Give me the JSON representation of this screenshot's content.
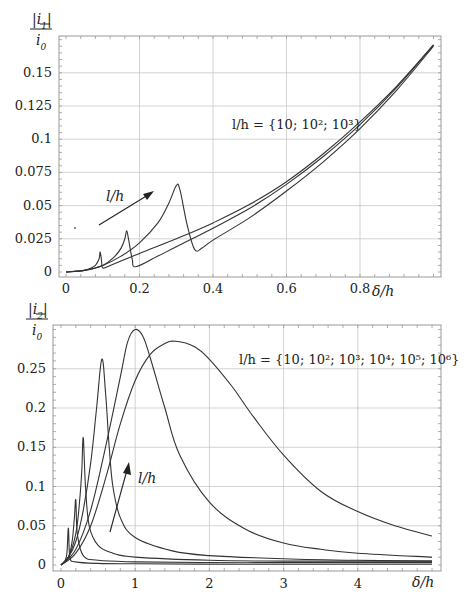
{
  "chart_data": [
    {
      "type": "line",
      "title": "",
      "ylabel": "|i_1| / i_0",
      "xlabel": "δ/h",
      "xlim": [
        0,
        1.02
      ],
      "ylim": [
        0,
        0.178
      ],
      "x_ticks": [
        "0",
        "0.2",
        "0.4",
        "0.6",
        "0.8"
      ],
      "y_ticks": [
        "0",
        "0.025",
        "0.05",
        "0.075",
        "0.1",
        "0.125",
        "0.15"
      ],
      "grid": true,
      "annotation": "l/h = {10; 10²; 10³}",
      "arrow_label": "l/h",
      "series": [
        {
          "name": "l/h = 10",
          "x": [
            0,
            0.03,
            0.06,
            0.08,
            0.09,
            0.093,
            0.097,
            0.1,
            0.12,
            0.2,
            0.3,
            0.4,
            0.5,
            0.6,
            0.7,
            0.8,
            0.9,
            1.0
          ],
          "y": [
            0,
            0.0005,
            0.002,
            0.005,
            0.01,
            0.015,
            0.008,
            0.003,
            0.005,
            0.014,
            0.025,
            0.037,
            0.051,
            0.068,
            0.089,
            0.113,
            0.14,
            0.171
          ]
        },
        {
          "name": "l/h = 100",
          "x": [
            0,
            0.05,
            0.1,
            0.13,
            0.15,
            0.16,
            0.165,
            0.17,
            0.18,
            0.19,
            0.25,
            0.3,
            0.4,
            0.5,
            0.6,
            0.7,
            0.8,
            0.9,
            1.0
          ],
          "y": [
            0,
            0.0012,
            0.005,
            0.011,
            0.018,
            0.025,
            0.031,
            0.025,
            0.01,
            0.004,
            0.012,
            0.019,
            0.033,
            0.048,
            0.066,
            0.087,
            0.111,
            0.139,
            0.171
          ]
        },
        {
          "name": "l/h = 1000",
          "x": [
            0,
            0.05,
            0.1,
            0.15,
            0.2,
            0.25,
            0.28,
            0.3,
            0.31,
            0.33,
            0.35,
            0.37,
            0.4,
            0.5,
            0.6,
            0.7,
            0.8,
            0.9,
            1.0
          ],
          "y": [
            0,
            0.0012,
            0.005,
            0.012,
            0.022,
            0.037,
            0.052,
            0.065,
            0.062,
            0.035,
            0.017,
            0.018,
            0.024,
            0.041,
            0.061,
            0.083,
            0.108,
            0.137,
            0.17
          ]
        }
      ]
    },
    {
      "type": "line",
      "title": "",
      "ylabel": "|i_2| / i_0",
      "xlabel": "δ/h",
      "xlim": [
        0,
        5.1
      ],
      "ylim": [
        0,
        0.306
      ],
      "x_ticks": [
        "0",
        "1",
        "2",
        "3",
        "4"
      ],
      "y_ticks": [
        "0",
        "0.05",
        "0.1",
        "0.15",
        "0.2",
        "0.25"
      ],
      "grid": true,
      "annotation": "l/h = {10; 10²; 10³; 10⁴; 10⁵; 10⁶}",
      "arrow_label": "l/h",
      "series": [
        {
          "name": "l/h = 10",
          "x": [
            0,
            0.05,
            0.08,
            0.1,
            0.12,
            0.2,
            0.5,
            1,
            2,
            3,
            4,
            5
          ],
          "y": [
            0,
            0.005,
            0.015,
            0.047,
            0.01,
            0.004,
            0.002,
            0.0015,
            0.001,
            0.001,
            0.001,
            0.001
          ]
        },
        {
          "name": "l/h = 100",
          "x": [
            0,
            0.1,
            0.15,
            0.18,
            0.2,
            0.22,
            0.3,
            0.5,
            1,
            2,
            3,
            4,
            5
          ],
          "y": [
            0,
            0.01,
            0.03,
            0.06,
            0.083,
            0.04,
            0.012,
            0.006,
            0.004,
            0.003,
            0.003,
            0.003,
            0.003
          ]
        },
        {
          "name": "l/h = 1000",
          "x": [
            0,
            0.1,
            0.2,
            0.25,
            0.28,
            0.3,
            0.33,
            0.38,
            0.5,
            0.7,
            1,
            2,
            3,
            4,
            5
          ],
          "y": [
            0,
            0.01,
            0.04,
            0.08,
            0.12,
            0.162,
            0.1,
            0.05,
            0.025,
            0.015,
            0.01,
            0.006,
            0.005,
            0.005,
            0.005
          ]
        },
        {
          "name": "l/h = 10^4",
          "x": [
            0,
            0.1,
            0.2,
            0.3,
            0.4,
            0.48,
            0.55,
            0.6,
            0.65,
            0.7,
            0.8,
            1,
            1.5,
            2,
            3,
            4,
            5
          ],
          "y": [
            0,
            0.01,
            0.03,
            0.07,
            0.13,
            0.2,
            0.262,
            0.22,
            0.15,
            0.1,
            0.06,
            0.035,
            0.018,
            0.012,
            0.008,
            0.006,
            0.005
          ]
        },
        {
          "name": "l/h = 10^5",
          "x": [
            0,
            0.2,
            0.4,
            0.6,
            0.8,
            0.9,
            1.0,
            1.1,
            1.2,
            1.4,
            1.6,
            2,
            2.5,
            3,
            3.5,
            4,
            5
          ],
          "y": [
            0,
            0.02,
            0.07,
            0.15,
            0.24,
            0.285,
            0.3,
            0.292,
            0.265,
            0.2,
            0.14,
            0.08,
            0.045,
            0.028,
            0.02,
            0.015,
            0.01
          ]
        },
        {
          "name": "l/h = 10^6",
          "x": [
            0,
            0.2,
            0.4,
            0.6,
            0.8,
            1.0,
            1.2,
            1.4,
            1.55,
            1.8,
            2.0,
            2.3,
            2.6,
            3.0,
            3.5,
            4.0,
            4.5,
            5.0
          ],
          "y": [
            0,
            0.015,
            0.05,
            0.11,
            0.18,
            0.235,
            0.268,
            0.282,
            0.285,
            0.278,
            0.262,
            0.228,
            0.188,
            0.14,
            0.094,
            0.068,
            0.05,
            0.037
          ]
        }
      ]
    }
  ]
}
